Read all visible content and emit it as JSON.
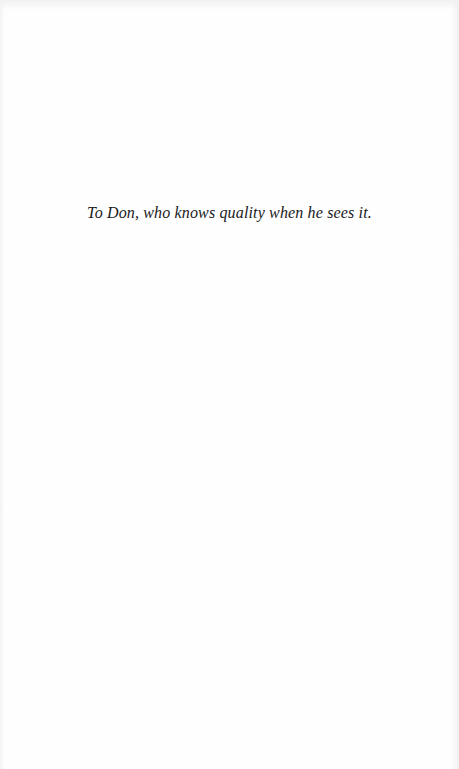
{
  "page": {
    "type": "dedication",
    "dedication_text": "To Don, who knows quality when he sees it."
  }
}
